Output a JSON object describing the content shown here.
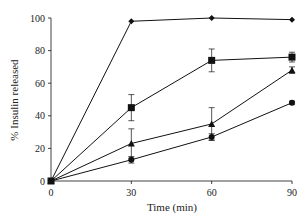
{
  "chart_data": {
    "type": "line",
    "title": "",
    "xlabel": "Time (min)",
    "ylabel": "% Insulin released",
    "x": [
      0,
      30,
      60,
      90
    ],
    "xticks": [
      0,
      30,
      60,
      90
    ],
    "yticks": [
      0,
      20,
      40,
      60,
      80,
      100
    ],
    "xlim": [
      0,
      90
    ],
    "ylim": [
      0,
      100
    ],
    "grid": false,
    "legend": null,
    "series": [
      {
        "name": "diamond",
        "marker": "diamond",
        "values": [
          0,
          98,
          100,
          99
        ],
        "errors": [
          0,
          0,
          0,
          0
        ]
      },
      {
        "name": "square",
        "marker": "square",
        "values": [
          0,
          45,
          74,
          76
        ],
        "errors": [
          0,
          8,
          7,
          3
        ]
      },
      {
        "name": "triangle",
        "marker": "triangle",
        "values": [
          0,
          23,
          35,
          68
        ],
        "errors": [
          0,
          9,
          10,
          2
        ]
      },
      {
        "name": "circle",
        "marker": "circle",
        "values": [
          0,
          13,
          27,
          48
        ],
        "errors": [
          0,
          2,
          2,
          1
        ]
      }
    ],
    "color": "#111111"
  }
}
